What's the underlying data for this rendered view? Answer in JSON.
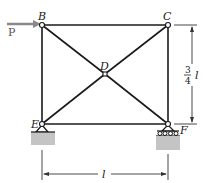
{
  "diagram": {
    "type": "truss",
    "nodes": {
      "B": {
        "label": "B",
        "x": 42,
        "y": 25
      },
      "C": {
        "label": "C",
        "x": 168,
        "y": 25
      },
      "D": {
        "label": "D",
        "x": 105,
        "y": 74
      },
      "E": {
        "label": "E",
        "x": 42,
        "y": 124
      },
      "F": {
        "label": "F",
        "x": 168,
        "y": 124
      }
    },
    "members": [
      "BC",
      "BE",
      "CF",
      "EF",
      "BD",
      "DF",
      "CD",
      "DE"
    ],
    "load": {
      "label": "P",
      "at": "B",
      "direction": "right"
    },
    "supports": {
      "E": "pin",
      "F": "roller"
    },
    "dimensions": {
      "height": {
        "numerator": "3",
        "denominator": "4",
        "variable": "l"
      },
      "width": {
        "variable": "l"
      }
    },
    "colors": {
      "member": "#1a1a1a",
      "load_arrow": "#8a8a8a",
      "ground": "#c4c4c4",
      "dimension": "#333333"
    }
  }
}
